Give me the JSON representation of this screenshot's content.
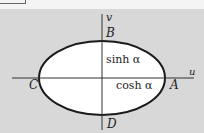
{
  "diagram": {
    "axes": {
      "horizontal_label": "u",
      "vertical_label": "v"
    },
    "points": {
      "A": "A",
      "B": "B",
      "C": "C",
      "D": "D"
    },
    "annotations": {
      "semi_minor": "sinh α",
      "semi_major": "cosh α"
    },
    "colors": {
      "background": "#d8d8d8",
      "ellipse_fill": "#ffffff",
      "stroke": "#1a1a1a"
    }
  }
}
